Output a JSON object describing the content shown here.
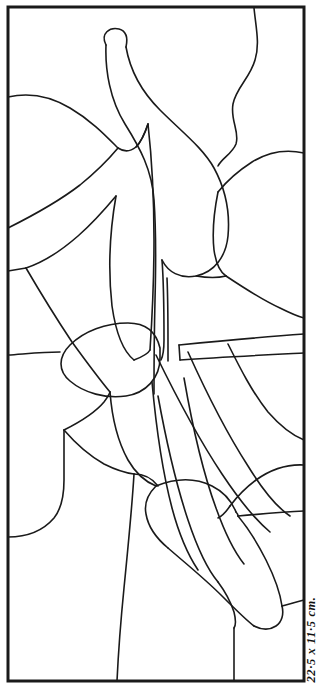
{
  "document": {
    "type": "stained-glass-pattern",
    "title": "Stained Glass Pattern Template"
  },
  "caption": {
    "dimensions_text": "22·5 x 11·5 cm."
  },
  "style": {
    "ink_color": "#1a1a1a",
    "paper_color": "#ffffff",
    "border_width_px": 3,
    "lead_line_width_px": 1.6
  },
  "frame": {
    "x": 8,
    "y": 7,
    "width": 296,
    "height": 674
  },
  "chart_data": {
    "type": "line",
    "xlabel": "",
    "ylabel": "",
    "xlim": [
      0,
      330
    ],
    "ylim": [
      0,
      694
    ],
    "grid": false,
    "legend": false,
    "paths": [
      {
        "name": "outer-frame",
        "d": "M 8 7 L 304 7 L 304 681 L 8 681 Z",
        "closed": true
      },
      {
        "name": "stem-left-outer",
        "d": "M 106 45 C 100 33 110 27 119 29 C 126 31 128 38 126 47"
      },
      {
        "name": "stem-left-down",
        "d": "M 106 45 C 105 70 110 100 125 124 C 140 148 152 170 154 200 C 156 228 156 262 155 300 C 154 340 154 370 154 394"
      },
      {
        "name": "stem-right-down",
        "d": "M 126 47 C 130 70 142 92 160 110 C 182 132 203 148 214 168 C 226 190 230 214 228 236 C 226 256 215 272 196 276 C 180 279 168 272 162 260"
      },
      {
        "name": "s-curve-right",
        "d": "M 254 8 C 256 28 260 44 255 60 C 250 78 236 88 233 104 C 230 120 240 132 236 144 C 232 154 222 158 218 166"
      },
      {
        "name": "left-ridge-upper",
        "d": "M 8 97 C 30 92 50 96 70 108 C 92 121 106 136 118 148"
      },
      {
        "name": "left-ridge-upper-2",
        "d": "M 118 148 C 124 152 130 152 136 147 C 142 141 145 133 148 124"
      },
      {
        "name": "left-arc-mid",
        "d": "M 8 228 C 32 216 58 202 80 185 C 96 172 108 160 118 148"
      },
      {
        "name": "left-arc-lower",
        "d": "M 26 268 C 44 262 62 250 78 236 C 94 222 106 208 116 196"
      },
      {
        "name": "left-short-tick",
        "d": "M 8 271 C 14 270 20 269 26 268"
      },
      {
        "name": "left-lower-fan",
        "d": "M 26 268 C 40 292 56 318 72 342 C 88 364 100 380 110 392"
      },
      {
        "name": "leaf-center-left-edge",
        "d": "M 116 196 C 110 230 108 270 112 306 C 116 334 124 352 134 360"
      },
      {
        "name": "leaf-center-right-edge",
        "d": "M 148 124 C 152 160 154 200 154 240 C 154 280 152 320 150 350"
      },
      {
        "name": "leaf-center-bottom",
        "d": "M 134 360 C 142 357 148 354 150 350"
      },
      {
        "name": "mid-oval",
        "d": "M 160 348 C 156 331 146 323 128 323 C 106 323 84 331 70 345 C 58 357 58 371 70 381 C 84 393 106 399 126 396 C 146 393 160 378 160 358 Z",
        "closed": true
      },
      {
        "name": "left-of-oval-tick",
        "d": "M 8 355 C 24 354 42 352 60 352"
      },
      {
        "name": "band-upper",
        "d": "M 179 345 C 220 341 262 337 304 334"
      },
      {
        "name": "band-lower",
        "d": "M 180 360 C 222 357 264 355 304 353"
      },
      {
        "name": "band-left-cap",
        "d": "M 179 345 L 180 360"
      },
      {
        "name": "stem-inner-right",
        "d": "M 167 278 C 168 300 168 326 168 346 C 168 352 168 357 168 361"
      },
      {
        "name": "stem-flare-left",
        "d": "M 162 260 C 164 286 164 312 164 340 C 164 350 163 356 161 360"
      },
      {
        "name": "right-top-arc",
        "d": "M 304 153 C 286 149 268 152 252 162 C 238 171 226 182 218 192"
      },
      {
        "name": "right-bowl-left",
        "d": "M 218 192 C 214 212 212 232 214 250 C 216 264 220 272 226 276"
      },
      {
        "name": "right-bowl-bottom",
        "d": "M 196 276 C 208 278 218 278 226 276"
      },
      {
        "name": "right-lower-sweep",
        "d": "M 226 276 C 244 288 262 300 280 308 C 292 314 300 317 304 318"
      },
      {
        "name": "right-mid-sweep-2",
        "d": "M 228 344 C 240 368 252 392 268 412 C 282 428 294 436 304 440"
      },
      {
        "name": "right-lower-arc",
        "d": "M 304 465 C 286 464 270 470 256 480 C 244 489 236 498 230 506"
      },
      {
        "name": "right-lower-arc-2",
        "d": "M 230 506 C 226 512 222 516 218 518"
      },
      {
        "name": "inner-left-fan-a",
        "d": "M 110 392 C 112 418 118 442 128 460 C 136 474 146 482 156 486"
      },
      {
        "name": "inner-left-fan-b",
        "d": "M 64 430 C 80 422 94 414 104 402 C 107 398 109 395 110 392"
      },
      {
        "name": "left-bump",
        "d": "M 8 537 C 26 537 42 532 54 518 C 62 508 64 494 64 480 C 64 462 64 444 64 430"
      },
      {
        "name": "left-big-leaf",
        "d": "M 64 430 C 76 444 90 456 104 464 C 116 470 126 473 134 474"
      },
      {
        "name": "mid-stem-long",
        "d": "M 134 474 C 132 508 128 548 124 588 C 120 628 118 660 117 681"
      },
      {
        "name": "mid-leaf-right",
        "d": "M 134 474 C 144 474 152 478 158 486"
      },
      {
        "name": "band2-outer",
        "d": "M 158 396 C 166 440 176 484 188 520 C 198 550 208 570 218 582"
      },
      {
        "name": "band2-inner",
        "d": "M 184 378 C 192 424 202 470 216 508 C 226 536 236 554 244 564"
      },
      {
        "name": "band3-outer",
        "d": "M 152 382 C 156 426 162 470 172 508 C 180 538 190 558 198 570"
      },
      {
        "name": "diagonal-band-top",
        "d": "M 156 355 C 176 396 198 438 222 474 C 242 504 258 522 270 532"
      },
      {
        "name": "diagonal-band-bottom",
        "d": "M 188 352 C 206 392 226 432 248 466 C 264 492 278 508 290 516"
      },
      {
        "name": "shoe-top",
        "d": "M 156 486 C 176 478 196 478 212 486 C 224 492 232 502 236 512"
      },
      {
        "name": "shoe-left",
        "d": "M 156 486 C 148 494 144 504 146 514 C 148 526 156 538 168 548"
      },
      {
        "name": "shoe-sole",
        "d": "M 168 548 C 184 562 204 578 222 596 C 236 610 246 620 254 626"
      },
      {
        "name": "shoe-heel",
        "d": "M 254 626 C 262 630 270 630 276 626 C 282 622 284 614 282 606"
      },
      {
        "name": "shoe-back",
        "d": "M 282 606 C 280 592 274 576 266 560 C 258 544 248 528 238 516"
      },
      {
        "name": "shoe-inner-line",
        "d": "M 236 512 C 238 514 238 515 238 516"
      },
      {
        "name": "shoe-vert-drop",
        "d": "M 234 628 C 234 646 234 664 234 681"
      },
      {
        "name": "shoe-foot-front",
        "d": "M 218 582 C 224 590 230 600 234 612 C 236 620 236 625 234 628"
      },
      {
        "name": "right-tick-to-border",
        "d": "M 238 516 C 260 514 282 512 304 511"
      },
      {
        "name": "right-of-shoe-line",
        "d": "M 282 606 C 290 604 296 602 304 600"
      },
      {
        "name": "upper-mid-arc",
        "d": "M 136 147 C 142 141 145 133 148 124"
      },
      {
        "name": "top-left-small",
        "d": "M 8 97 C 8 97 8 97 8 97"
      }
    ]
  }
}
